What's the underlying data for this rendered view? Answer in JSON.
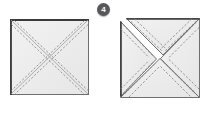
{
  "figure": {
    "background_color": "#ffffff",
    "step_badge": {
      "number": "4",
      "shape": "circle",
      "fill_color": "#58585a",
      "text_color": "#ffffff"
    },
    "colors": {
      "fabric_fill": "#ebeaea",
      "fabric_fill_light": "#f2f1f1",
      "outline_dark": "#3a3a3a",
      "outline_mid": "#6e6e6e",
      "stitch_line": "#8d8d8d",
      "gap_white": "#ffffff"
    },
    "panels": [
      {
        "id": "left-panel",
        "name": "square-with-marked-diagonals",
        "description": "Square fabric patch with two dashed stitching lines drawn on either side of each corner-to-corner diagonal",
        "x": 10,
        "y": 19,
        "width": 79,
        "height": 76,
        "separated": false,
        "triangles": [
          "top",
          "right",
          "bottom",
          "left"
        ],
        "diagonals": 2,
        "stitch_lines_per_diagonal": 2,
        "stitch_style": "dashed"
      },
      {
        "id": "right-panel",
        "name": "square-cut-into-four-triangles",
        "description": "Same square after cutting along both diagonals; the top and left triangles are slid outward leaving white gaps while the right and bottom triangles stay joined",
        "x": 120,
        "y": 18,
        "width": 80,
        "height": 80,
        "separated": true,
        "triangles": [
          "top",
          "right",
          "bottom",
          "left"
        ],
        "separated_triangles": [
          "top",
          "left"
        ],
        "diagonals": 2,
        "stitch_lines_per_diagonal": 2,
        "stitch_style": "dashed"
      }
    ]
  }
}
